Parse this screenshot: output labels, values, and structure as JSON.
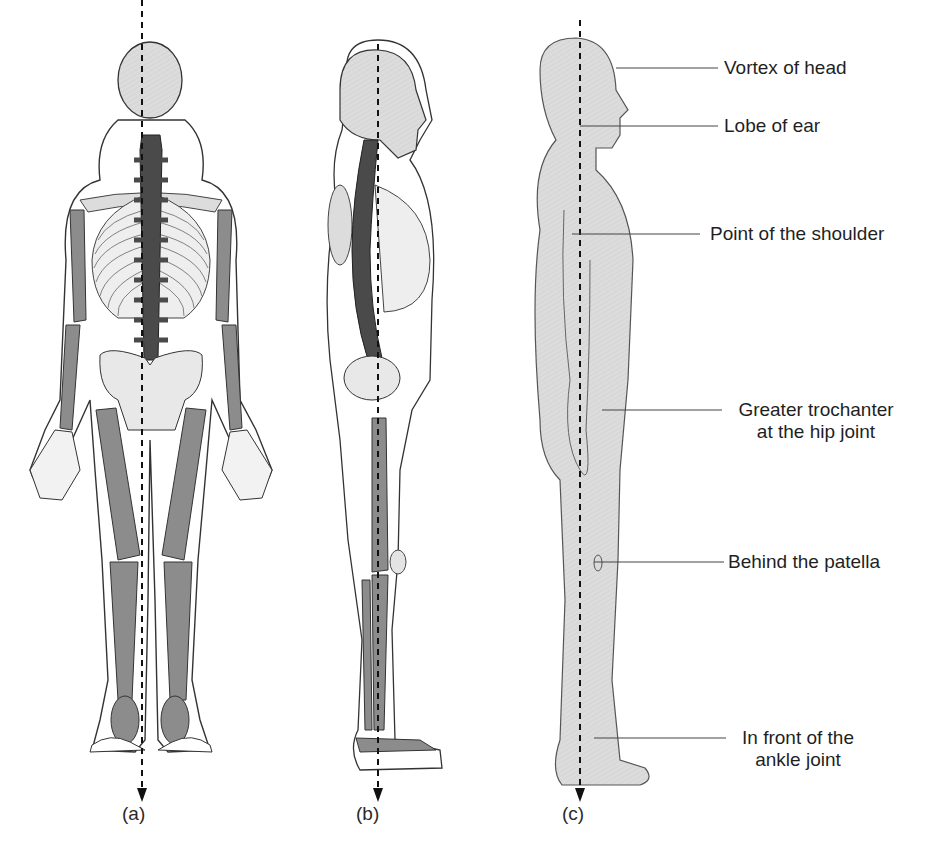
{
  "figure": {
    "panels": [
      {
        "id": "a",
        "label": "(a)",
        "view": "posterior skeleton"
      },
      {
        "id": "b",
        "label": "(b)",
        "view": "lateral skeleton"
      },
      {
        "id": "c",
        "label": "(c)",
        "view": "lateral body outline"
      }
    ],
    "landmarks": [
      {
        "id": "vortex",
        "text": "Vortex of head"
      },
      {
        "id": "ear",
        "text": "Lobe of ear"
      },
      {
        "id": "shoulder",
        "text": "Point of the shoulder"
      },
      {
        "id": "hip_line1",
        "text": "Greater trochanter"
      },
      {
        "id": "hip_line2",
        "text": "at the hip joint"
      },
      {
        "id": "patella",
        "text": "Behind the patella"
      },
      {
        "id": "ankle_line1",
        "text": "In front of the"
      },
      {
        "id": "ankle_line2",
        "text": "ankle joint"
      }
    ],
    "colors": {
      "bone_dark": "#4a4a4a",
      "bone_mid": "#8c8c8c",
      "bone_light": "#dcdcdc",
      "body_fill": "#d9d9d9",
      "outline": "#333333",
      "line_of_gravity": "#111111"
    }
  }
}
